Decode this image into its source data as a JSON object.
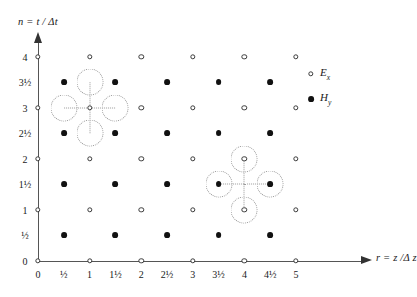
{
  "figure": {
    "type": "scatter",
    "axes": {
      "x": {
        "label": "r = z /Δ z",
        "ticks": [
          "0",
          "½",
          "1",
          "1½",
          "2",
          "2½",
          "3",
          "3½",
          "4",
          "4½",
          "5"
        ],
        "tick_values": [
          0,
          0.5,
          1,
          1.5,
          2,
          2.5,
          3,
          3.5,
          4,
          4.5,
          5
        ],
        "range": [
          0,
          5.5
        ]
      },
      "y": {
        "label": "n = t / Δt",
        "ticks": [
          "0",
          "½",
          "1",
          "1½",
          "2",
          "2½",
          "3",
          "3½",
          "4"
        ],
        "tick_values": [
          0,
          0.5,
          1,
          1.5,
          2,
          2.5,
          3,
          3.5,
          4
        ],
        "range": [
          0,
          4.3
        ]
      }
    },
    "legend": [
      {
        "symbol": "open-circle",
        "label_main": "E",
        "label_sub": "x",
        "name": "legend-ex"
      },
      {
        "symbol": "filled-circle",
        "label_main": "H",
        "label_sub": "y",
        "name": "legend-hy"
      }
    ]
  },
  "chart_data": {
    "type": "scatter",
    "title": "",
    "xlabel": "r = z /Δ z",
    "ylabel": "n = t / Δt",
    "xlim": [
      0,
      5.5
    ],
    "ylim": [
      0,
      4.3
    ],
    "grid": false,
    "legend_position": "top-right",
    "series": [
      {
        "name": "Ex",
        "marker": "open-circle",
        "x": [
          0,
          1,
          2,
          3,
          4,
          5,
          0,
          1,
          2,
          3,
          4,
          5,
          0,
          1,
          2,
          3,
          4,
          5,
          0,
          1,
          2,
          3,
          4,
          5,
          0,
          1,
          2,
          3,
          4,
          5
        ],
        "y": [
          0,
          0,
          0,
          0,
          0,
          0,
          1,
          1,
          1,
          1,
          1,
          1,
          2,
          2,
          2,
          2,
          2,
          2,
          3,
          3,
          3,
          3,
          3,
          3,
          4,
          4,
          4,
          4,
          4,
          4
        ]
      },
      {
        "name": "Hy",
        "marker": "filled-circle",
        "x": [
          0.5,
          1.5,
          2.5,
          3.5,
          4.5,
          0.5,
          1.5,
          2.5,
          3.5,
          4.5,
          0.5,
          1.5,
          2.5,
          3.5,
          4.5,
          0.5,
          1.5,
          2.5,
          3.5,
          4.5
        ],
        "y": [
          0.5,
          0.5,
          0.5,
          0.5,
          0.5,
          1.5,
          1.5,
          1.5,
          1.5,
          1.5,
          2.5,
          2.5,
          2.5,
          2.5,
          2.5,
          3.5,
          3.5,
          3.5,
          3.5,
          3.5
        ]
      }
    ],
    "annotations": [
      {
        "name": "update-stencil-ex",
        "center": [
          1,
          3
        ],
        "center_type": "Ex",
        "highlighted_neighbors": [
          {
            "x": 1,
            "y": 3.5,
            "type": "Hy"
          },
          {
            "x": 1,
            "y": 2.5,
            "type": "Hy"
          },
          {
            "x": 0.5,
            "y": 3,
            "type": "Ex"
          },
          {
            "x": 1.5,
            "y": 3,
            "type": "Ex"
          }
        ]
      },
      {
        "name": "update-stencil-hy",
        "center": [
          4,
          1.5
        ],
        "center_type": "Hy",
        "highlighted_neighbors": [
          {
            "x": 4,
            "y": 2,
            "type": "Ex"
          },
          {
            "x": 4,
            "y": 1,
            "type": "Ex"
          },
          {
            "x": 3.5,
            "y": 1.5,
            "type": "Hy"
          },
          {
            "x": 4.5,
            "y": 1.5,
            "type": "Hy"
          }
        ]
      }
    ]
  }
}
